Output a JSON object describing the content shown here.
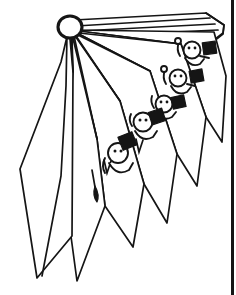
{
  "canvas": {
    "width": 236,
    "height": 295,
    "background_color": "#ffffff",
    "ink_color": "#151515",
    "title": "Fanned page stack with ring binder and four cartoon figures"
  },
  "border": {
    "right_rule_label": "right edge rule",
    "x": 231,
    "width": 3,
    "color": "#151515"
  },
  "binder_ring": {
    "label": "binder ring grommet",
    "center_x": 70,
    "center_y": 27,
    "radius_x": 12,
    "radius_y": 11,
    "stroke_width": 3.1
  },
  "pages": [
    {
      "id": "page-left-large",
      "label": "large left cover panel",
      "path": "M70 30 L62 63 L20 168 L36 278 L70 239 Z"
    },
    {
      "id": "page-2",
      "label": "second fanned page",
      "path": "M70 30 L72 72 L62 177 L76 280 L104 205 L96 140 Z"
    },
    {
      "id": "page-3",
      "label": "third fanned page",
      "path": "M70 30 L96 140 L104 205 L132 245 L143 185 L120 102 Z"
    },
    {
      "id": "page-4",
      "label": "fourth fanned page",
      "path": "M70 30 L120 102 L143 185 L166 222 L176 155 L150 72 Z"
    },
    {
      "id": "page-5",
      "label": "fifth fanned page",
      "path": "M70 30 L150 72 L176 155 L196 185 L205 118 L180 46 Z"
    },
    {
      "id": "page-6",
      "label": "sixth fanned page",
      "path": "M70 30 L180 46 L205 118 L220 140 L224 74 L212 30 Z"
    },
    {
      "id": "page-top-slab",
      "label": "top page slab",
      "path": "M70 18 L208 14 L222 26 L220 46 L84 42 Z"
    }
  ],
  "spine_ribs": {
    "label": "fanned page edge ribs radiating from ring",
    "origin_x": 70,
    "origin_y": 30,
    "count": 7
  },
  "figures": [
    {
      "id": "figure-1",
      "label": "cartoon figure top right with black flag",
      "head_x": 192,
      "head_y": 50,
      "head_r": 8,
      "box_x": 208,
      "box_y": 48,
      "box_size": 13,
      "box_rotation": -8,
      "stalk": "left antenna with knob",
      "eyes": 2
    },
    {
      "id": "figure-2",
      "label": "cartoon figure second with black flag",
      "head_x": 178,
      "head_y": 78,
      "head_r": 8,
      "box_x": 196,
      "box_y": 76,
      "box_size": 13,
      "box_rotation": -10,
      "stalk": "left antenna with knob",
      "eyes": 2
    },
    {
      "id": "figure-3",
      "label": "cartoon figure third with black box",
      "head_x": 164,
      "head_y": 104,
      "head_r": 8,
      "box_x": 178,
      "box_y": 104,
      "box_size": 13,
      "box_rotation": -12,
      "stalk": "short arm",
      "eyes": 2
    },
    {
      "id": "figure-4",
      "label": "cartoon figure fourth with black box",
      "head_x": 143,
      "head_y": 122,
      "head_r": 9,
      "box_x": 156,
      "box_y": 118,
      "box_size": 14,
      "box_rotation": -18,
      "stalk": "short arm",
      "eyes": 2
    },
    {
      "id": "figure-5",
      "label": "cartoon figure bottom left with black box hat",
      "head_x": 118,
      "head_y": 153,
      "head_r": 10,
      "box_x": 127,
      "box_y": 142,
      "box_size": 15,
      "box_rotation": -22,
      "stalk": "left arm",
      "eyes": 2
    }
  ],
  "details": {
    "leaf_tip_label": "small pointed leaf tip on inner page edge",
    "leaf_tip_x": 96,
    "leaf_tip_y": 196
  }
}
